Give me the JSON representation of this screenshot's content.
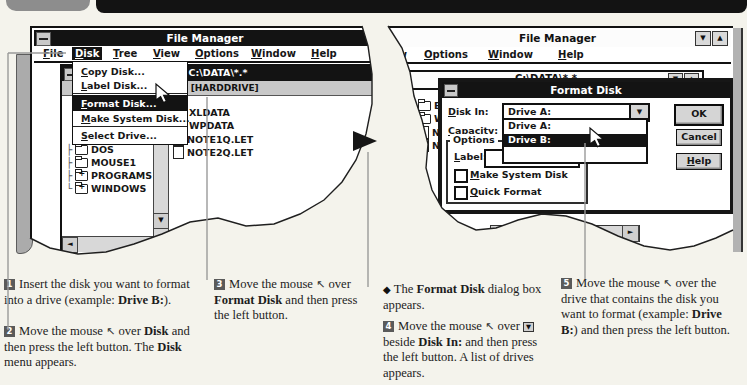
{
  "glyphs": {
    "cursor": "↖",
    "down_arrow": "▼",
    "up_arrow": "▲",
    "left_arrow": "◄",
    "right_arrow": "►",
    "minimize": "▼",
    "maximize": "▲",
    "next_screen_arrow": "►",
    "note_bullet": "◆"
  },
  "colors": {
    "titlebar": "#131313",
    "menu_highlight": "#131313",
    "button_face": "#d5d5d5",
    "page_background": "#f4f3ec",
    "callout_line": "#999999"
  },
  "left_screen": {
    "title": "File Manager",
    "menu": [
      {
        "label": "File",
        "u": 0
      },
      {
        "label": "Disk",
        "u": 0
      },
      {
        "label": "Tree",
        "u": 0
      },
      {
        "label": "View",
        "u": 0
      },
      {
        "label": "Options",
        "u": 0
      },
      {
        "label": "Window",
        "u": 0
      },
      {
        "label": "Help",
        "u": 0
      }
    ],
    "disk_menu": [
      {
        "label": "Copy Disk...",
        "u": 0
      },
      {
        "label": "Label Disk...",
        "u": 0
      },
      {
        "label": "Format Disk...",
        "u": 0
      },
      {
        "label": "Make System Disk...",
        "u": 0
      },
      {
        "label": "Select Drive...",
        "u": 0
      }
    ],
    "dir": {
      "title": "C:\\DATA\\*.*",
      "drive": "C: [HARDDRIVE]",
      "tree": [
        {
          "label": "WPDATA",
          "conn": "└"
        },
        {
          "label": "DOS",
          "conn": "├"
        },
        {
          "label": "MOUSE1",
          "conn": "├"
        },
        {
          "label": "PROGRAMS",
          "conn": "├"
        },
        {
          "label": "WINDOWS",
          "conn": "└"
        }
      ],
      "files": [
        {
          "label": "XLDATA"
        },
        {
          "label": "WPDATA"
        },
        {
          "label": "NOTE1Q.LET"
        },
        {
          "label": "NOTE2Q.LET"
        }
      ]
    }
  },
  "right_screen": {
    "title": "File Manager",
    "menu": [
      {
        "label": "ew"
      },
      {
        "label": "Options",
        "u": 0
      },
      {
        "label": "Window",
        "u": 0
      },
      {
        "label": "Help",
        "u": 0
      }
    ],
    "dir_title": "C:\\DATA\\*.*",
    "partial_files": [
      {
        "label": "E"
      },
      {
        "label": "W"
      },
      {
        "label": "N"
      },
      {
        "label": "N"
      }
    ],
    "dialog": {
      "title": "Format Disk",
      "disk_in": {
        "label": "Disk In:",
        "u": 0
      },
      "disk_in_value": "Drive A:",
      "capacity": {
        "label": "Capacity:",
        "u": 0
      },
      "drive_list": [
        {
          "label": "Drive A:"
        },
        {
          "label": "Drive B:"
        },
        {
          "label": ""
        }
      ],
      "options_group": "Options",
      "label_field": {
        "label": "Label:",
        "u": 0,
        "value": ""
      },
      "make_system": {
        "label": "Make System Disk",
        "u": 0
      },
      "quick_format": {
        "label": "Quick Format",
        "u": 0
      },
      "ok": "OK",
      "cancel": "Cancel",
      "help": {
        "label": "Help",
        "u": 0
      }
    }
  },
  "steps": {
    "s1": {
      "num": "1",
      "segments": [
        {
          "t": "Insert the disk you want to format into a drive (example: "
        },
        {
          "t": "Drive B:",
          "b": true
        },
        {
          "t": ")."
        }
      ]
    },
    "s2": {
      "num": "2",
      "segments": [
        {
          "t": "Move the mouse "
        },
        {
          "cursor": true
        },
        {
          "t": " over "
        },
        {
          "t": "Disk",
          "b": true
        },
        {
          "t": " and then press the left button. The "
        },
        {
          "t": "Disk",
          "b": true
        },
        {
          "t": " menu appears."
        }
      ]
    },
    "s3": {
      "num": "3",
      "segments": [
        {
          "t": "Move the mouse "
        },
        {
          "cursor": true
        },
        {
          "t": " over "
        },
        {
          "t": "Format Disk",
          "b": true
        },
        {
          "t": " and then press the left button."
        }
      ]
    },
    "note": {
      "bullet": "◆",
      "segments": [
        {
          "t": "The "
        },
        {
          "t": "Format Disk",
          "b": true
        },
        {
          "t": " dialog box appears."
        }
      ]
    },
    "s4": {
      "num": "4",
      "segments": [
        {
          "t": "Move the mouse "
        },
        {
          "cursor": true
        },
        {
          "t": " over "
        },
        {
          "key": true
        },
        {
          "t": " beside "
        },
        {
          "t": "Disk In:",
          "b": true
        },
        {
          "t": " and then press the left button. A list of drives appears."
        }
      ]
    },
    "s5": {
      "num": "5",
      "segments": [
        {
          "t": "Move the mouse "
        },
        {
          "cursor": true
        },
        {
          "t": " over the drive that contains the disk you want to format (example: "
        },
        {
          "t": "Drive B:",
          "b": true
        },
        {
          "t": ") and then press the left button."
        }
      ]
    }
  }
}
